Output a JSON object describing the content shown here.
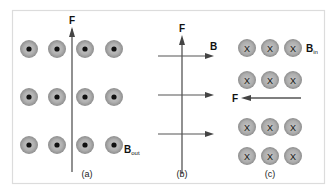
{
  "figure": {
    "colors": {
      "frame": "#dcdcdc",
      "circle_outer": "#9a9a9a",
      "circle_inner": "#bdbdbd",
      "dot": "#111111",
      "line": "#555555",
      "text": "#111111"
    },
    "panels": [
      {
        "id": "a",
        "caption": "(a)",
        "force_label": "F",
        "field_label": "B",
        "field_subscript": "out",
        "field_direction": "out-of-page",
        "force_direction": "up"
      },
      {
        "id": "b",
        "caption": "(b)",
        "force_label": "F",
        "field_label": "B",
        "field_direction": "right",
        "force_direction": "up"
      },
      {
        "id": "c",
        "caption": "(c)",
        "force_label": "F",
        "field_label": "B",
        "field_subscript": "in",
        "field_direction": "into-page",
        "force_direction": "left",
        "cross_symbol": "X"
      }
    ]
  }
}
